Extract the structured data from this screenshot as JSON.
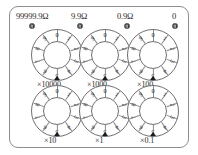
{
  "device": {
    "name": "decade-resistance-box",
    "case_border_color": "#8d8d8d",
    "ink_color": "#2b2b2b"
  },
  "terminals": [
    {
      "label": "99999.9Ω",
      "screw_icon": "terminal-screw-icon"
    },
    {
      "label": "9.9Ω",
      "screw_icon": "terminal-screw-icon"
    },
    {
      "label": "0.9Ω",
      "screw_icon": "terminal-screw-icon"
    },
    {
      "label": "0",
      "screw_icon": "terminal-screw-icon"
    }
  ],
  "dials": [
    {
      "id": "dial-x10000",
      "multiplier_label": "×10000",
      "digits": [
        "0",
        "1",
        "2",
        "3",
        "4",
        "5",
        "6",
        "7",
        "8",
        "9"
      ],
      "selected": "0",
      "pointer_icon": "pointer-triangle-icon"
    },
    {
      "id": "dial-x1000",
      "multiplier_label": "×1000",
      "digits": [
        "0",
        "1",
        "2",
        "3",
        "4",
        "5",
        "6",
        "7",
        "8",
        "9"
      ],
      "selected": "0",
      "pointer_icon": "pointer-triangle-icon"
    },
    {
      "id": "dial-x100",
      "multiplier_label": "×100",
      "digits": [
        "0",
        "1",
        "2",
        "3",
        "4",
        "5",
        "6",
        "7",
        "8",
        "9"
      ],
      "selected": "0",
      "pointer_icon": "pointer-triangle-icon"
    },
    {
      "id": "dial-x10",
      "multiplier_label": "×10",
      "digits": [
        "0",
        "1",
        "2",
        "3",
        "4",
        "5",
        "6",
        "7",
        "8",
        "9"
      ],
      "selected": "0",
      "pointer_icon": "pointer-triangle-icon"
    },
    {
      "id": "dial-x1",
      "multiplier_label": "×1",
      "digits": [
        "0",
        "1",
        "2",
        "3",
        "4",
        "5",
        "6",
        "7",
        "8",
        "9"
      ],
      "selected": "0",
      "pointer_icon": "pointer-triangle-icon"
    },
    {
      "id": "dial-x0.1",
      "multiplier_label": "×0.1",
      "digits": [
        "0",
        "1",
        "2",
        "3",
        "4",
        "5",
        "6",
        "7",
        "8",
        "9"
      ],
      "selected": "0",
      "pointer_icon": "pointer-triangle-icon"
    }
  ]
}
